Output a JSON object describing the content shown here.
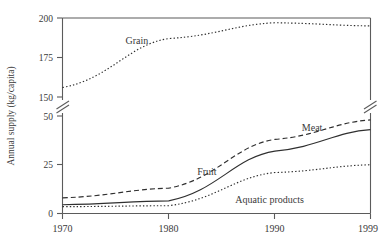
{
  "chart_data": {
    "type": "line",
    "title": "",
    "xlabel": "",
    "ylabel": "Annual supply (kg/capita)",
    "x": [
      1970,
      1980,
      1990,
      1999
    ],
    "xlim": [
      1970,
      1999
    ],
    "x_tick_labels": [
      "1970",
      "1980",
      "1990",
      "1999"
    ],
    "y_tick_labels": [
      "0",
      "25",
      "50",
      "150",
      "175",
      "200"
    ],
    "y_axis_break": {
      "present": true,
      "between": [
        50,
        150
      ],
      "lower_range": [
        0,
        50
      ],
      "upper_range": [
        150,
        200
      ]
    },
    "grid": false,
    "legend_position": "inline-labels",
    "series": [
      {
        "name": "Grain",
        "style": "dotted",
        "label": "Grain",
        "values": [
          156,
          187,
          197,
          195
        ]
      },
      {
        "name": "Meat",
        "style": "dashed",
        "label": "Meat",
        "values": [
          8,
          13,
          38,
          48
        ]
      },
      {
        "name": "Fruit",
        "style": "solid",
        "label": "Fruit",
        "values": [
          4.5,
          6.5,
          32,
          43
        ]
      },
      {
        "name": "Aquatic products",
        "style": "dotted",
        "label": "Aquatic products",
        "values": [
          3.5,
          4,
          21,
          25
        ]
      }
    ],
    "annotations": [
      {
        "text": "Grain",
        "x": 1977.0,
        "y_label_px": 44
      },
      {
        "text": "Meat",
        "x": 1993.5,
        "y_label_px": 131
      },
      {
        "text": "Fruit",
        "x": 1983.6,
        "y_label_px": 175
      },
      {
        "text": "Aquatic products",
        "x": 1989.5,
        "y_label_px": 203
      }
    ]
  },
  "colors": {
    "axis": "#5b5b5b",
    "series": "#2f2f2f",
    "text": "#3a3a3a",
    "background": "#ffffff"
  }
}
